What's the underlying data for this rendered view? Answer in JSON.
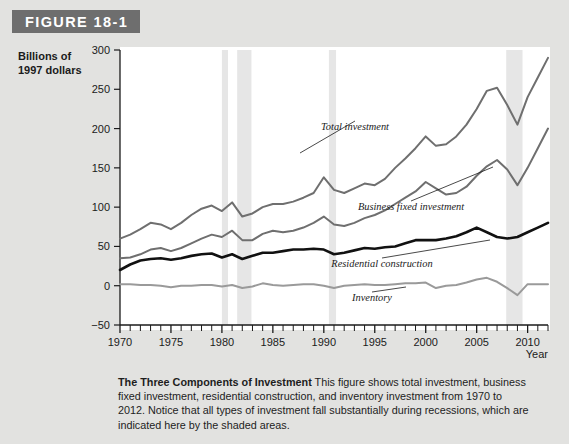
{
  "figure": {
    "badge_label": "FIGURE 18-1",
    "badge_color": "#6e6e6e"
  },
  "caption": {
    "title": "The Three Components of Investment",
    "body": " This figure shows total investment, business fixed investment, residential construction, and inventory investment from 1970 to 2012. Notice that all types of investment fall substantially during recessions, which are indicated here by the shaded areas."
  },
  "chart_data": {
    "type": "line",
    "title": "",
    "ylabel_line1": "Billions of",
    "ylabel_line2": "1997 dollars",
    "xlabel": "Year",
    "xlim": [
      1970,
      2012
    ],
    "ylim": [
      -50,
      300
    ],
    "yticks": [
      -50,
      0,
      50,
      100,
      150,
      200,
      250,
      300
    ],
    "xticks_major": [
      1970,
      1975,
      1980,
      1985,
      1990,
      1995,
      2000,
      2005,
      2010
    ],
    "xtick_minor_step": 1,
    "grid": false,
    "legend": "inline-annotations",
    "recession_bands": [
      {
        "start": 1980.0,
        "end": 1980.6
      },
      {
        "start": 1981.5,
        "end": 1982.9
      },
      {
        "start": 1990.5,
        "end": 1991.2
      },
      {
        "start": 2007.9,
        "end": 2009.5
      }
    ],
    "x": [
      1970,
      1971,
      1972,
      1973,
      1974,
      1975,
      1976,
      1977,
      1978,
      1979,
      1980,
      1981,
      1982,
      1983,
      1984,
      1985,
      1986,
      1987,
      1988,
      1989,
      1990,
      1991,
      1992,
      1993,
      1994,
      1995,
      1996,
      1997,
      1998,
      1999,
      2000,
      2001,
      2002,
      2003,
      2004,
      2005,
      2006,
      2007,
      2008,
      2009,
      2010,
      2011,
      2012
    ],
    "series": [
      {
        "name": "Total investment",
        "color": "#6f6f6f",
        "values": [
          60,
          65,
          72,
          80,
          78,
          72,
          80,
          90,
          98,
          102,
          95,
          106,
          88,
          92,
          100,
          104,
          104,
          107,
          112,
          118,
          138,
          122,
          118,
          124,
          130,
          128,
          136,
          150,
          162,
          175,
          190,
          178,
          180,
          190,
          205,
          225,
          248,
          252,
          230,
          205,
          240,
          265,
          290
        ]
      },
      {
        "name": "Business fixed investment",
        "color": "#6f6f6f",
        "values": [
          35,
          36,
          40,
          46,
          48,
          44,
          48,
          54,
          60,
          65,
          62,
          70,
          58,
          58,
          66,
          70,
          68,
          70,
          74,
          80,
          88,
          78,
          76,
          80,
          86,
          90,
          96,
          104,
          112,
          120,
          132,
          124,
          116,
          118,
          126,
          140,
          152,
          160,
          148,
          128,
          150,
          175,
          200
        ]
      },
      {
        "name": "Residential construction",
        "color": "#111111",
        "values": [
          20,
          27,
          32,
          34,
          35,
          33,
          35,
          38,
          40,
          41,
          36,
          40,
          34,
          38,
          42,
          42,
          44,
          46,
          46,
          47,
          46,
          40,
          42,
          45,
          48,
          47,
          49,
          50,
          54,
          58,
          58,
          58,
          60,
          63,
          68,
          74,
          68,
          62,
          60,
          62,
          68,
          74,
          80
        ]
      },
      {
        "name": "Inventory",
        "color": "#9a9a9a",
        "values": [
          2,
          2,
          1,
          1,
          0,
          -2,
          0,
          0,
          1,
          1,
          -1,
          1,
          -3,
          -1,
          3,
          1,
          0,
          1,
          2,
          2,
          0,
          -3,
          0,
          1,
          2,
          1,
          1,
          2,
          3,
          3,
          4,
          -3,
          0,
          1,
          4,
          8,
          10,
          5,
          -3,
          -12,
          2,
          2,
          2
        ]
      }
    ],
    "annotations": [
      {
        "text": "Total investment",
        "x": 355,
        "y": 130,
        "leader_to_x": 300,
        "leader_to_y": 153
      },
      {
        "text": "Business fixed investment",
        "x": 411,
        "y": 210,
        "leader_to_x": 493,
        "leader_to_y": 167
      },
      {
        "text": "Residential construction",
        "x": 382,
        "y": 267,
        "leader_to_x": 490,
        "leader_to_y": 240
      },
      {
        "text": "Inventory",
        "x": 372,
        "y": 301,
        "leader_to_x": 406,
        "leader_to_y": 287
      }
    ]
  }
}
